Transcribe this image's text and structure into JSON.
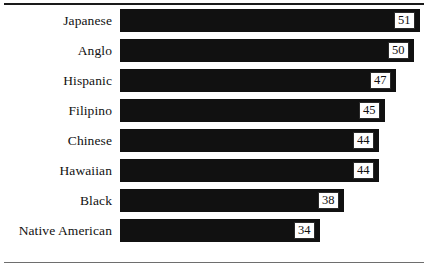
{
  "chart_data": {
    "type": "bar",
    "orientation": "horizontal",
    "title": "",
    "subtitle": "",
    "xlabel": "",
    "ylabel": "",
    "categories": [
      "Japanese",
      "Anglo",
      "Hispanic",
      "Filipino",
      "Chinese",
      "Hawaiian",
      "Black",
      "Native American"
    ],
    "values": [
      51,
      50,
      47,
      45,
      44,
      44,
      38,
      34
    ],
    "value_labels": [
      "51",
      "50",
      "47",
      "45",
      "44",
      "44",
      "38",
      "34"
    ],
    "xlim": [
      0,
      51
    ],
    "grid": false,
    "legend": false,
    "legend_position": "none",
    "series": [
      {
        "name": "",
        "values": [
          51,
          50,
          47,
          45,
          44,
          44,
          38,
          34
        ]
      }
    ],
    "annotations": [],
    "bar_color": "#111111",
    "value_box_fill": "#ffffff",
    "value_box_border": "#2a2a2a",
    "background": "#ffffff",
    "rule_top_color": "#1a1a1a",
    "rule_bottom_color": "#6e6e6e"
  }
}
